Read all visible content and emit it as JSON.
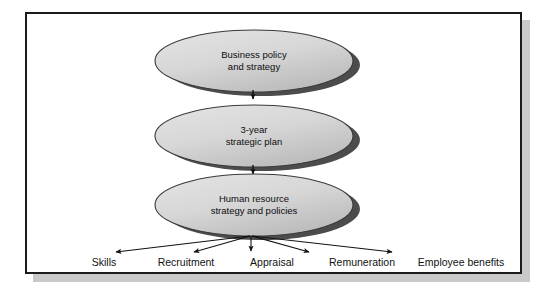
{
  "diagram": {
    "type": "flow-cascade",
    "colors": {
      "frame_border": "#1b1b1b",
      "frame_shadow": "#c9c9c9",
      "ellipse_fill_light": "#dcdcdc",
      "ellipse_fill_dark": "#b6b6b6",
      "ellipse_stroke": "#3a3a3a",
      "ellipse_shadow": "#4c4c4c",
      "arrow": "#111111",
      "text": "#0d0d0d",
      "background": "#ffffff"
    },
    "nodes": [
      {
        "id": "node-business-policy",
        "line1": "Business policy",
        "line2": "and strategy"
      },
      {
        "id": "node-strategic-plan",
        "line1": "3-year",
        "line2": "strategic plan"
      },
      {
        "id": "node-hr-strategy",
        "line1": "Human resource",
        "line2": "strategy and policies"
      }
    ],
    "connectors": [
      {
        "id": "connector-policy-to-plan",
        "from": "node-business-policy",
        "to": "node-strategic-plan",
        "style": "arrow-down"
      },
      {
        "id": "connector-plan-to-hr",
        "from": "node-strategic-plan",
        "to": "node-hr-strategy",
        "style": "arrow-down"
      }
    ],
    "outputs": [
      {
        "id": "output-skills",
        "label": "Skills"
      },
      {
        "id": "output-recruitment",
        "label": "Recruitment"
      },
      {
        "id": "output-appraisal",
        "label": "Appraisal"
      },
      {
        "id": "output-remuneration",
        "label": "Remuneration"
      },
      {
        "id": "output-employee-benefits",
        "label": "Employee benefits"
      }
    ]
  }
}
